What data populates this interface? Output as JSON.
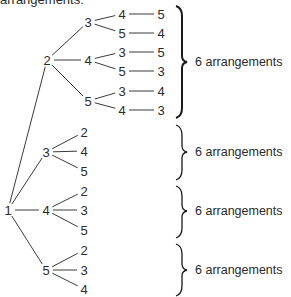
{
  "caption": "arrangements:",
  "tree": {
    "root": {
      "label": "1",
      "x": 8,
      "y": 210
    },
    "level2": [
      {
        "label": "2",
        "x": 47,
        "y": 60
      },
      {
        "label": "3",
        "x": 46,
        "y": 152
      },
      {
        "label": "4",
        "x": 46,
        "y": 210
      },
      {
        "label": "5",
        "x": 46,
        "y": 270
      }
    ],
    "level3": [
      {
        "label": "3",
        "x": 88,
        "y": 22,
        "parent": 0
      },
      {
        "label": "4",
        "x": 88,
        "y": 60,
        "parent": 0
      },
      {
        "label": "5",
        "x": 88,
        "y": 101,
        "parent": 0
      },
      {
        "label": "2",
        "x": 84,
        "y": 132,
        "parent": 1
      },
      {
        "label": "4",
        "x": 84,
        "y": 151,
        "parent": 1
      },
      {
        "label": "5",
        "x": 84,
        "y": 171,
        "parent": 1
      },
      {
        "label": "2",
        "x": 84,
        "y": 191,
        "parent": 2
      },
      {
        "label": "3",
        "x": 84,
        "y": 210,
        "parent": 2
      },
      {
        "label": "5",
        "x": 84,
        "y": 230,
        "parent": 2
      },
      {
        "label": "2",
        "x": 84,
        "y": 250,
        "parent": 3
      },
      {
        "label": "3",
        "x": 84,
        "y": 270,
        "parent": 3
      },
      {
        "label": "4",
        "x": 84,
        "y": 289,
        "parent": 3
      }
    ],
    "level4": [
      {
        "label": "4",
        "x": 122,
        "y": 14,
        "parent": 0
      },
      {
        "label": "5",
        "x": 122,
        "y": 33,
        "parent": 0
      },
      {
        "label": "3",
        "x": 122,
        "y": 52,
        "parent": 1
      },
      {
        "label": "5",
        "x": 122,
        "y": 71,
        "parent": 1
      },
      {
        "label": "3",
        "x": 122,
        "y": 91,
        "parent": 2
      },
      {
        "label": "4",
        "x": 122,
        "y": 110,
        "parent": 2
      }
    ],
    "level5": [
      {
        "label": "5",
        "x": 161,
        "y": 14,
        "parent": 0
      },
      {
        "label": "4",
        "x": 161,
        "y": 33,
        "parent": 1
      },
      {
        "label": "5",
        "x": 161,
        "y": 52,
        "parent": 2
      },
      {
        "label": "3",
        "x": 161,
        "y": 71,
        "parent": 3
      },
      {
        "label": "4",
        "x": 161,
        "y": 91,
        "parent": 4
      },
      {
        "label": "3",
        "x": 161,
        "y": 110,
        "parent": 5
      }
    ]
  },
  "groups": [
    {
      "label": "6 arrangements",
      "top": 6,
      "bottom": 118,
      "mid": 62
    },
    {
      "label": "6 arrangements",
      "top": 125,
      "bottom": 180,
      "mid": 152
    },
    {
      "label": "6 arrangements",
      "top": 186,
      "bottom": 238,
      "mid": 211
    },
    {
      "label": "6 arrangements",
      "top": 244,
      "bottom": 296,
      "mid": 270
    }
  ],
  "colors": {
    "line": "#3a3a3a",
    "text": "#2a2a2a",
    "background": "#ffffff"
  }
}
